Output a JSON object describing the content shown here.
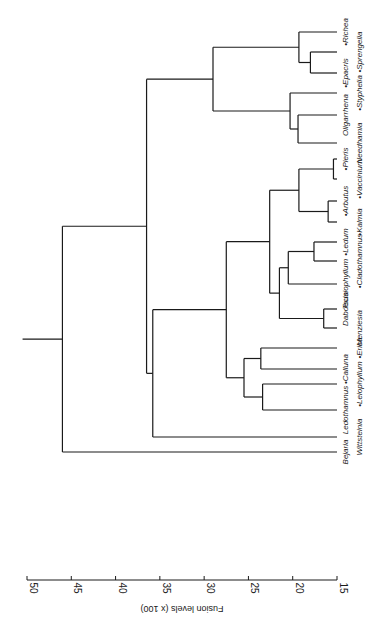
{
  "chart_data": {
    "type": "dendrogram",
    "title": "",
    "xlabel": "Fusion levels (x 100)",
    "axis": {
      "ticks": [
        50,
        45,
        40,
        35,
        30,
        25,
        20,
        15
      ],
      "range": [
        15,
        50
      ],
      "orientation": "rotated 90deg; axis along bottom, read from right-to-left"
    },
    "leaves": [
      {
        "name": "Richea",
        "marked": true
      },
      {
        "name": "Sprengelia",
        "marked": true
      },
      {
        "name": "Epacris",
        "marked": true
      },
      {
        "name": "Styphelia",
        "marked": true
      },
      {
        "name": "Oligarrhena",
        "marked": false
      },
      {
        "name": "Needhamia",
        "marked": false
      },
      {
        "name": "Pieris",
        "marked": true
      },
      {
        "name": "Vaccinium",
        "marked": true
      },
      {
        "name": "Arbutus",
        "marked": true
      },
      {
        "name": "Kalmia",
        "marked": true
      },
      {
        "name": "Ledum",
        "marked": true
      },
      {
        "name": "Cladothamnus",
        "marked": true
      },
      {
        "name": "Tsusiophyllum",
        "marked": false
      },
      {
        "name": "Daboecia",
        "marked": false
      },
      {
        "name": "Menziesia",
        "marked": false
      },
      {
        "name": "Erica",
        "marked": true
      },
      {
        "name": "Calluna",
        "marked": true
      },
      {
        "name": "Leiophyllum",
        "marked": true
      },
      {
        "name": "Ledothamnus",
        "marked": false
      },
      {
        "name": "Wittsteinia",
        "marked": false
      },
      {
        "name": "Bejaria",
        "marked": false
      }
    ],
    "merges": [
      {
        "id": "m1",
        "children": [
          "Sprengelia",
          "Epacris"
        ],
        "level": 18.0
      },
      {
        "id": "m2",
        "children": [
          "Richea",
          "m1"
        ],
        "level": 19.3
      },
      {
        "id": "m3",
        "children": [
          "Oligarrhena",
          "Needhamia"
        ],
        "level": 19.4
      },
      {
        "id": "m4",
        "children": [
          "Styphelia",
          "m3"
        ],
        "level": 20.3
      },
      {
        "id": "m5",
        "children": [
          "m2",
          "m4"
        ],
        "level": 29.0
      },
      {
        "id": "m6",
        "children": [
          "Pieris",
          "Vaccinium"
        ],
        "level": 15.4
      },
      {
        "id": "m7",
        "children": [
          "Arbutus",
          "Kalmia"
        ],
        "level": 16.0
      },
      {
        "id": "m8",
        "children": [
          "m6",
          "m7"
        ],
        "level": 19.3
      },
      {
        "id": "m9",
        "children": [
          "Ledum",
          "Cladothamnus"
        ],
        "level": 17.6
      },
      {
        "id": "m10",
        "children": [
          "m9",
          "Tsusiophyllum"
        ],
        "level": 20.5
      },
      {
        "id": "m11",
        "children": [
          "Daboecia",
          "Menziesia"
        ],
        "level": 16.5
      },
      {
        "id": "m12",
        "children": [
          "m10",
          "m11"
        ],
        "level": 21.5
      },
      {
        "id": "m13",
        "children": [
          "m8",
          "m12"
        ],
        "level": 22.6
      },
      {
        "id": "m14",
        "children": [
          "Erica",
          "Calluna"
        ],
        "level": 23.6
      },
      {
        "id": "m15",
        "children": [
          "Leiophyllum",
          "Ledothamnus"
        ],
        "level": 23.4
      },
      {
        "id": "m16",
        "children": [
          "m14",
          "m15"
        ],
        "level": 25.5
      },
      {
        "id": "m17",
        "children": [
          "m13",
          "m16"
        ],
        "level": 27.5
      },
      {
        "id": "m18",
        "children": [
          "m17",
          "Wittsteinia"
        ],
        "level": 35.8
      },
      {
        "id": "m19",
        "children": [
          "m5",
          "m18"
        ],
        "level": 36.5
      },
      {
        "id": "m20",
        "children": [
          "m19",
          "Bejaria"
        ],
        "level": 46.0
      }
    ],
    "root_stem_level": 50.5,
    "note": "Leaf names prefixed with a dot marker in the figure are flagged marked=true"
  },
  "layout": {
    "axis_y": 580,
    "level_min": 15,
    "level_max": 50,
    "x_at_min": 337,
    "x_at_max": 27,
    "leaf_tip_x": 337,
    "leaf_y": {
      "Richea": 32,
      "Sprengelia": 52,
      "Epacris": 73,
      "Styphelia": 93,
      "Oligarrhena": 115,
      "Needhamia": 143,
      "Pieris": 159,
      "Vaccinium": 179,
      "Arbutus": 201,
      "Kalmia": 222,
      "Ledum": 242,
      "Cladothamnus": 261,
      "Tsusiophyllum": 284,
      "Daboecia": 309,
      "Menziesia": 328,
      "Erica": 348,
      "Calluna": 369,
      "Leiophyllum": 384,
      "Ledothamnus": 410,
      "Wittsteinia": 437,
      "Bejaria": 452
    },
    "label_column": {
      "Richea": 1,
      "Sprengelia": 2,
      "Epacris": 1,
      "Styphelia": 2,
      "Oligarrhena": 1,
      "Needhamia": 2,
      "Pieris": 1,
      "Vaccinium": 2,
      "Arbutus": 1,
      "Kalmia": 2,
      "Ledum": 1,
      "Cladothamnus": 2,
      "Tsusiophyllum": 1,
      "Daboecia": 1,
      "Menziesia": 2,
      "Erica": 2,
      "Calluna": 1,
      "Leiophyllum": 2,
      "Ledothamnus": 1,
      "Wittsteinia": 2,
      "Bejaria": 1
    }
  }
}
